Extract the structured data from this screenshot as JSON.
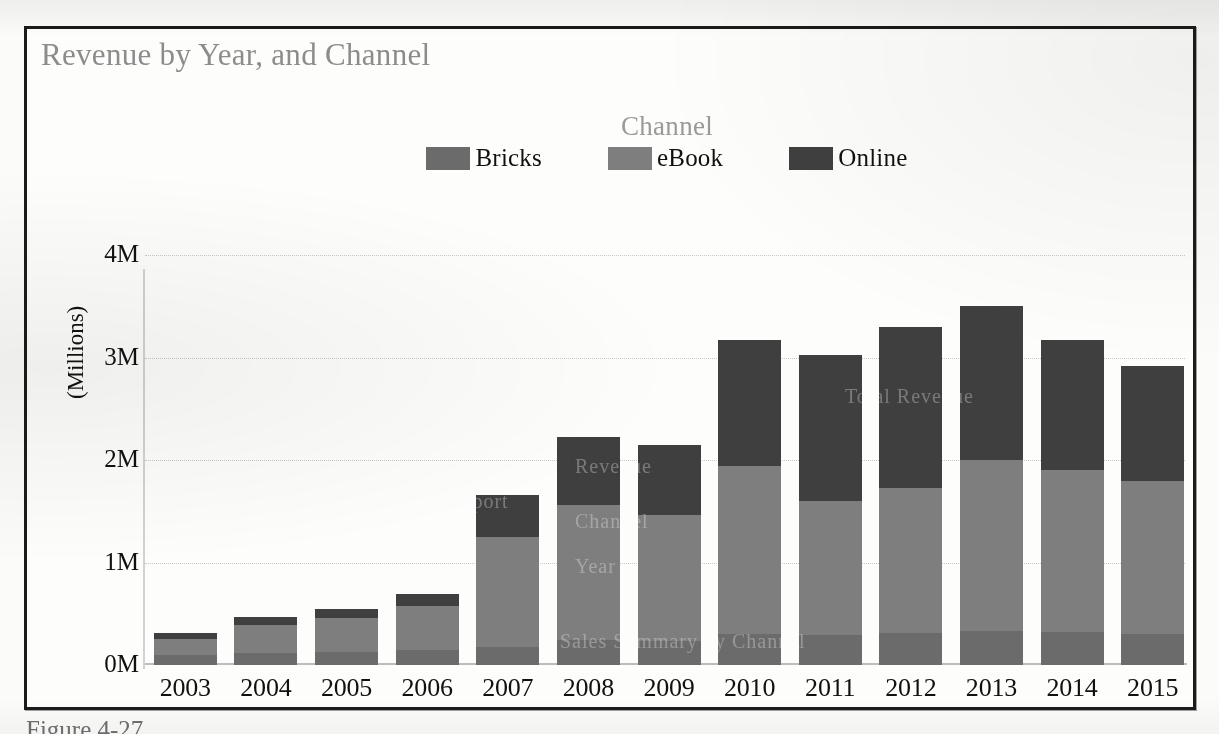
{
  "figure": {
    "title": "Revenue by Year, and Channel",
    "caption": "Figure 4-27.",
    "page_bleed_text": "· · ·   ·  ·· · ·   ·  ·  ·· ·  ·   ·    ·· ·  ·  ·· ·    ·· ·  ·   ·  ·· ·   ·· · ·  ·· ·   · ·  ·· · ·"
  },
  "legend": {
    "title": "Channel",
    "items": [
      {
        "label": "Bricks",
        "color": "#6b6b6b"
      },
      {
        "label": "eBook",
        "color": "#7e7e7e"
      },
      {
        "label": "Online",
        "color": "#3f3f3f"
      }
    ]
  },
  "axes": {
    "y_title": "(Millions)",
    "y_ticks": [
      "0M",
      "1M",
      "2M",
      "3M",
      "4M"
    ],
    "y_tick_values": [
      0,
      1000000,
      2000000,
      3000000,
      4000000
    ]
  },
  "watermarks": [
    {
      "text": "Sales Report",
      "x": 250,
      "y": 235
    },
    {
      "text": "Total Revenue",
      "x": 700,
      "y": 130
    },
    {
      "text": "Revenue",
      "x": 430,
      "y": 200
    },
    {
      "text": "Channel",
      "x": 430,
      "y": 255
    },
    {
      "text": "Year",
      "x": 430,
      "y": 300
    },
    {
      "text": "Sales Summary by Channel",
      "x": 415,
      "y": 375
    }
  ],
  "chart_data": {
    "type": "bar",
    "subtype": "stacked",
    "title": "Revenue by Year, and Channel",
    "xlabel": "",
    "ylabel": "(Millions)",
    "ylim": [
      0,
      4000000
    ],
    "grid": true,
    "legend_position": "top",
    "categories": [
      "2003",
      "2004",
      "2005",
      "2006",
      "2007",
      "2008",
      "2009",
      "2010",
      "2011",
      "2012",
      "2013",
      "2014",
      "2015"
    ],
    "series": [
      {
        "name": "Bricks",
        "color": "#6b6b6b",
        "values": [
          100000,
          120000,
          130000,
          150000,
          180000,
          240000,
          230000,
          300000,
          290000,
          310000,
          330000,
          320000,
          300000
        ]
      },
      {
        "name": "eBook",
        "color": "#7e7e7e",
        "values": [
          150000,
          270000,
          330000,
          430000,
          1070000,
          1320000,
          1230000,
          1640000,
          1310000,
          1420000,
          1670000,
          1580000,
          1500000
        ]
      },
      {
        "name": "Online",
        "color": "#3f3f3f",
        "values": [
          60000,
          80000,
          90000,
          110000,
          410000,
          660000,
          690000,
          1230000,
          1420000,
          1570000,
          1500000,
          1270000,
          1120000
        ]
      }
    ],
    "totals": [
      310000,
      470000,
      550000,
      690000,
      1660000,
      2220000,
      2150000,
      3170000,
      3020000,
      3300000,
      3500000,
      3170000,
      2920000
    ]
  }
}
